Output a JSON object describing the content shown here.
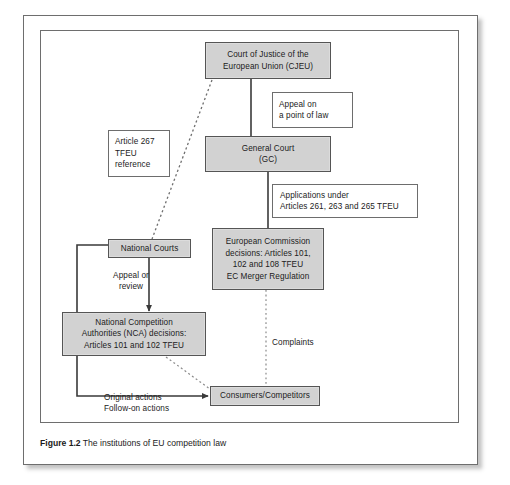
{
  "figure": {
    "caption_label": "Figure 1.2",
    "caption_text": "The institutions of EU competition law"
  },
  "colors": {
    "shaded_fill": "#d2d2d2",
    "box_border": "#555555",
    "plain_border": "#6d6d6d",
    "frame_border": "#6e6e6e",
    "text": "#1b1b1b",
    "connector": "#3a3a3a"
  },
  "nodes": {
    "cjeu": {
      "label": "Court of Justice of the\nEuropean Union (CJEU)",
      "style": "shaded"
    },
    "appeal_point_of_law": {
      "label": "Appeal on\na point of law",
      "style": "plain"
    },
    "article_267": {
      "label": "Article 267\nTFEU\nreference",
      "style": "plain"
    },
    "general_court": {
      "label": "General Court\n(GC)",
      "style": "shaded"
    },
    "applications_under": {
      "label": "Applications under\nArticles 261, 263 and 265 TFEU",
      "style": "plain"
    },
    "national_courts": {
      "label": "National Courts",
      "style": "shaded"
    },
    "european_commission": {
      "label": "European Commission\ndecisions:  Articles 101,\n102 and 108 TFEU\nEC Merger Regulation",
      "style": "shaded"
    },
    "appeal_or_review": {
      "label": "Appeal or\nreview",
      "style": "label"
    },
    "national_competition_authorities": {
      "label": "National Competition\nAuthorities (NCA) decisions:\nArticles 101 and 102 TFEU",
      "style": "shaded"
    },
    "complaints": {
      "label": "Complaints",
      "style": "label"
    },
    "consumers_competitors": {
      "label": "Consumers/Competitors",
      "style": "shaded"
    },
    "original_follow_on_actions": {
      "label": "Original actions\nFollow-on actions",
      "style": "label"
    }
  },
  "connectors": [
    {
      "name": "cjeu-to-general-court",
      "style": "solid",
      "from": "cjeu",
      "to": "general_court"
    },
    {
      "name": "general-court-to-commission",
      "style": "solid",
      "from": "general_court",
      "to": "european_commission"
    },
    {
      "name": "cjeu-to-national-courts",
      "style": "dotted",
      "from": "cjeu",
      "to": "national_courts"
    },
    {
      "name": "national-courts-to-nca",
      "style": "solid",
      "from": "national_courts",
      "to": "national_competition_authorities"
    },
    {
      "name": "commission-to-consumers",
      "style": "dotted",
      "from": "european_commission",
      "to": "consumers_competitors"
    },
    {
      "name": "nca-to-consumers",
      "style": "dotted",
      "from": "national_competition_authorities",
      "to": "consumers_competitors"
    },
    {
      "name": "national-courts-to-consumers",
      "style": "solid-arrow",
      "from": "national_courts",
      "to": "consumers_competitors"
    }
  ]
}
